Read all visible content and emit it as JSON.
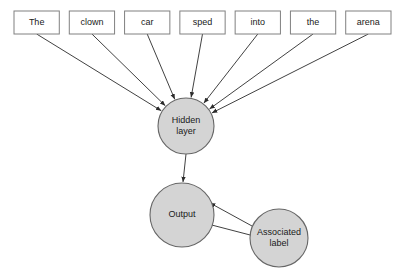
{
  "diagram": {
    "colors": {
      "node_fill": "#d4d4d4",
      "node_stroke": "#666666",
      "box_fill": "#ffffff",
      "box_stroke": "#808080",
      "edge": "#2b2b2b",
      "background": "#ffffff"
    },
    "word_boxes": [
      {
        "label": "The",
        "x": 14,
        "y": 11,
        "w": 52,
        "h": 23
      },
      {
        "label": "clown",
        "x": 76,
        "y": 11,
        "w": 52,
        "h": 23
      },
      {
        "label": "car",
        "x": 138,
        "y": 11,
        "w": 52,
        "h": 23
      },
      {
        "label": "sped",
        "x": 200,
        "y": 11,
        "w": 52,
        "h": 23
      },
      {
        "label": "into",
        "x": 262,
        "y": 11,
        "w": 52,
        "h": 23
      },
      {
        "label": "the",
        "x": 324,
        "y": 11,
        "w": 52,
        "h": 23
      },
      {
        "label": "arena",
        "x": 338,
        "y": 11,
        "w": 52,
        "h": 23
      }
    ],
    "nodes": [
      {
        "id": "hidden-layer",
        "lines": [
          "Hidden",
          "layer"
        ],
        "cx": 186,
        "cy": 126,
        "r": 28
      },
      {
        "id": "output",
        "lines": [
          "Output"
        ],
        "cx": 182,
        "cy": 215,
        "r": 32
      },
      {
        "id": "associated-label",
        "lines": [
          "Associated",
          "label"
        ],
        "cx": 279,
        "cy": 238,
        "r": 29
      }
    ],
    "edges": [
      {
        "id": "edge-the-to-hidden",
        "from": "The",
        "to": "hidden-layer",
        "arrow": true
      },
      {
        "id": "edge-clown-to-hidden",
        "from": "clown",
        "to": "hidden-layer",
        "arrow": true
      },
      {
        "id": "edge-car-to-hidden",
        "from": "car",
        "to": "hidden-layer",
        "arrow": true
      },
      {
        "id": "edge-sped-to-hidden",
        "from": "sped",
        "to": "hidden-layer",
        "arrow": true
      },
      {
        "id": "edge-into-to-hidden",
        "from": "into",
        "to": "hidden-layer",
        "arrow": true
      },
      {
        "id": "edge-the2-to-hidden",
        "from": "the",
        "to": "hidden-layer",
        "arrow": true
      },
      {
        "id": "edge-arena-to-hidden",
        "from": "arena",
        "to": "hidden-layer",
        "arrow": true
      },
      {
        "id": "edge-hidden-to-output",
        "from": "hidden-layer",
        "to": "output",
        "arrow": true
      },
      {
        "id": "edge-label-to-output-upper",
        "from": "associated-label",
        "to": "output",
        "arrow": true
      },
      {
        "id": "edge-label-to-output-lower",
        "from": "associated-label",
        "to": "output",
        "arrow": true
      }
    ]
  }
}
